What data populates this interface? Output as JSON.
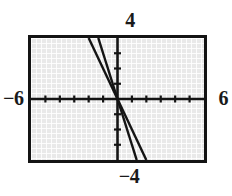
{
  "chart_data": {
    "type": "line",
    "title": "",
    "subtitle": "",
    "xlabel": "",
    "ylabel": "",
    "xlim": [
      -6,
      6
    ],
    "ylim": [
      -4,
      4
    ],
    "grid": true,
    "legend_position": "none",
    "x_tick_interval": 1,
    "y_tick_interval": 1,
    "x_ticks": [
      -5,
      -4,
      -3,
      -2,
      -1,
      1,
      2,
      3,
      4,
      5
    ],
    "y_ticks": [
      -3,
      -2,
      -1,
      1,
      2,
      3
    ],
    "annotations": {
      "top": "4",
      "bottom": "−4",
      "left": "−6",
      "right": "6"
    },
    "series": [
      {
        "name": "line-1",
        "slope": -2,
        "intercept": 0,
        "x": [
          -2,
          3
        ],
        "y": [
          4,
          -4
        ],
        "color": "#141414"
      },
      {
        "name": "line-2",
        "slope": -3,
        "intercept": 0,
        "x": [
          -1.33,
          1.33
        ],
        "y": [
          4,
          -4
        ],
        "color": "#141414"
      }
    ]
  },
  "graph": {
    "window": {
      "xmin": "−6",
      "xmax": "6",
      "ymin": "−4",
      "ymax": "4"
    },
    "background_color": "#e9e9e9",
    "border_color": "#141414",
    "axis_color": "#141414",
    "curve_color": "#141414"
  }
}
